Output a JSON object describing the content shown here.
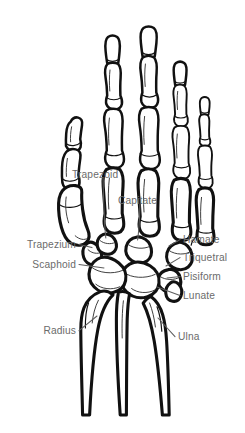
{
  "figure": {
    "view": "posterior (dorsal) view of right hand skeleton",
    "background_color": "#ffffff",
    "outline_color": "#111111",
    "label_color": "#6b6b6b",
    "leader_color": "#5e5e5e"
  },
  "labels": [
    {
      "id": "trapezoid",
      "text": "Trapezoid",
      "side": "free",
      "x": 72,
      "y": 174
    },
    {
      "id": "capitate",
      "text": "Capitate",
      "side": "free",
      "x": 118,
      "y": 200
    },
    {
      "id": "trapezium",
      "text": "Trapezium",
      "side": "left",
      "x": 76,
      "y": 248
    },
    {
      "id": "scaphoid",
      "text": "Scaphoid",
      "side": "left",
      "x": 76,
      "y": 268
    },
    {
      "id": "radius",
      "text": "Radius",
      "side": "left",
      "x": 76,
      "y": 334
    },
    {
      "id": "hamate",
      "text": "Hamate",
      "side": "right",
      "x": 183,
      "y": 243
    },
    {
      "id": "triquetral",
      "text": "Triquetral",
      "side": "right",
      "x": 183,
      "y": 261
    },
    {
      "id": "pisiform",
      "text": "Pisiform",
      "side": "right",
      "x": 183,
      "y": 280
    },
    {
      "id": "lunate",
      "text": "Lunate",
      "side": "right",
      "x": 183,
      "y": 299
    },
    {
      "id": "ulna",
      "text": "Ulna",
      "side": "right",
      "x": 178,
      "y": 340
    }
  ]
}
